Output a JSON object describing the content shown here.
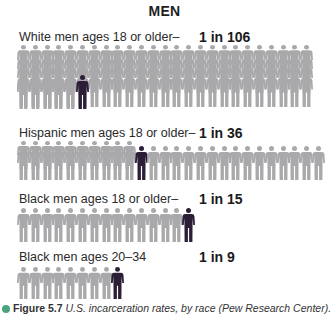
{
  "title": "MEN",
  "colors": {
    "figure_gray": "#a9a9ab",
    "figure_dark": "#2b1e36",
    "caption_bullet": "#49a57c"
  },
  "groups": [
    {
      "label": "White men ages 18 or older–",
      "rate": "1 in 106",
      "total": 106,
      "highlighted": 1
    },
    {
      "label": "Hispanic men ages 18 or older–",
      "rate": "1 in 36",
      "total": 36,
      "highlighted": 1
    },
    {
      "label": "Black men ages 18 or older–",
      "rate": "1 in 15",
      "total": 15,
      "highlighted": 1
    },
    {
      "label": "Black men ages 20–34",
      "rate": "1 in 9",
      "total": 9,
      "highlighted": 1
    }
  ],
  "caption": {
    "figure_number": "Figure 5.7",
    "text": " U.S. incarceration rates, by race (Pew Research Center)."
  },
  "chart_data": {
    "type": "pictograph",
    "title": "MEN",
    "unit": "men incarcerated out of N",
    "categories": [
      "White men ages 18 or older",
      "Hispanic men ages 18 or older",
      "Black men ages 18 or older",
      "Black men ages 20–34"
    ],
    "values": [
      106,
      36,
      15,
      9
    ],
    "labels": [
      "1 in 106",
      "1 in 36",
      "1 in 15",
      "1 in 9"
    ],
    "rates_percent": [
      0.94,
      2.78,
      6.67,
      11.11
    ],
    "caption": "Figure 5.7 U.S. incarceration rates, by race (Pew Research Center)."
  }
}
